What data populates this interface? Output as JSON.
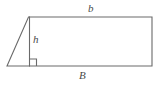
{
  "figure": {
    "background_color": "#ffffff",
    "stroke_color": "#6a6a6a",
    "label_color": "#4a4a4a",
    "stroke_width": 1.1,
    "labels": {
      "top_edge": "b",
      "height": "h",
      "bottom_edge": "B"
    },
    "shapes": {
      "outline_name": "prism-outline",
      "right_angle_marker_name": "right-angle-marker"
    },
    "geometry": {
      "apex_x": 28,
      "apex_y": 17,
      "left_vertex_x": 7,
      "left_vertex_y": 66,
      "right_top_x": 152,
      "right_top_y": 17,
      "right_bottom_x": 152,
      "right_bottom_y": 66,
      "height_line_x": 29,
      "right_angle_size": 7
    }
  }
}
